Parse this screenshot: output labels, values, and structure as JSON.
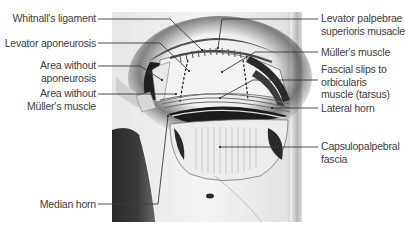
{
  "figure": {
    "labels_left": [
      {
        "id": "whitnalls-ligament",
        "lines": [
          "Whitnall's ligament"
        ]
      },
      {
        "id": "levator-aponeurosis",
        "lines": [
          "Levator aponeurosis"
        ]
      },
      {
        "id": "area-without-aponeurosis",
        "lines": [
          "Area without",
          "aponeurosis"
        ]
      },
      {
        "id": "area-without-mullers-muscle",
        "lines": [
          "Area without",
          "Müller's muscle"
        ]
      },
      {
        "id": "median-horn",
        "lines": [
          "Median horn"
        ]
      }
    ],
    "labels_right": [
      {
        "id": "levator-palpebrae-superioris",
        "lines": [
          "Levator palpebrae",
          "superioris musacle"
        ]
      },
      {
        "id": "mullers-muscle",
        "lines": [
          "Müller's muscle"
        ]
      },
      {
        "id": "fascial-slips",
        "lines": [
          "Fascial slips to",
          "orbicularis",
          "muscle (tarsus)"
        ]
      },
      {
        "id": "lateral-horn",
        "lines": [
          "Lateral horn"
        ]
      },
      {
        "id": "capsulopalpebral-fascia",
        "lines": [
          "Capsulopalpebral",
          "fascia"
        ]
      }
    ],
    "colors": {
      "background": "#ffffff",
      "label_text": "#3d3d3d",
      "leader_line": "#3a3a3a",
      "illustration_light": "#efefef",
      "illustration_dark": "#1e1e1e"
    }
  }
}
